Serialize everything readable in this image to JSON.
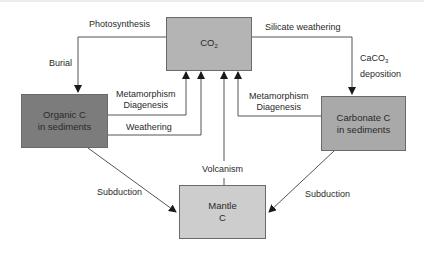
{
  "diagram": {
    "nodes": {
      "co2": {
        "label": "CO",
        "sub": "2",
        "fill": "#b4b4b4"
      },
      "organic": {
        "line1": "Organic C",
        "line2": "in sediments",
        "fill": "#7c7c7c"
      },
      "carbonate": {
        "line1": "Carbonate C",
        "line2": "in sediments",
        "fill": "#a9a9a9"
      },
      "mantle": {
        "line1": "Mantle",
        "line2": "C",
        "fill": "#cdcdcd"
      }
    },
    "edges": {
      "photosynthesis": "Photosynthesis",
      "burial": "Burial",
      "silicate_weathering": "Silicate weathering",
      "caco3_prefix": "CaCO",
      "caco3_sub": "3",
      "deposition": "deposition",
      "meta_left_1": "Metamorphism",
      "meta_left_2": "Diagenesis",
      "weathering": "Weathering",
      "meta_right_1": "Metamorphism",
      "meta_right_2": "Diagenesis",
      "volcanism": "Volcanism",
      "subduction_left": "Subduction",
      "subduction_right": "Subduction"
    }
  }
}
